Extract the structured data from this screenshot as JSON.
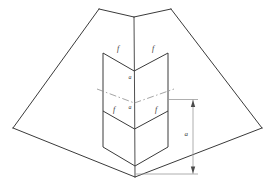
{
  "figure": {
    "background_color": "#ffffff",
    "line_color": "#3a3a3a",
    "centerline_color": "#777777",
    "dimension_color": "#8a8a8a",
    "width": 269,
    "height": 187
  },
  "labels": {
    "fold_top_left": "f",
    "fold_top_right": "f",
    "fold_bottom_left": "f",
    "fold_bottom_right": "f",
    "panel_upper": "a",
    "panel_lower": "a",
    "dimension_height": "a"
  },
  "geometry": {
    "outer_outline": "134,17 99,9 13,128 135,177 262,128 171,9",
    "outer_top_left_edge": "99,9 134,17",
    "outer_top_right_edge": "134,17 171,9",
    "outer_left_edge": "99,9 13,128",
    "outer_right_edge": "171,9 262,128",
    "outer_bottom_left_edge": "13,128 135,177",
    "outer_bottom_right_edge": "135,177 262,128",
    "spine_vertical": "134,17 135,177",
    "inner_left_vertical": "103,53 103,147",
    "inner_right_vertical": "168,53 168,147",
    "inner_upper_v_left": "103,53 134,71",
    "inner_upper_v_right": "134,71 168,53",
    "inner_mid_v_left": "103,111 134,129",
    "inner_mid_v_right": "134,129 168,111",
    "inner_lower_v_left": "103,147 135,166",
    "inner_lower_v_right": "135,166 168,147",
    "centerline": "99,89 134,103 172,89",
    "dim_line_x": 193,
    "dim_top_y": 99,
    "dim_bottom_y": 174,
    "dim_ext_top": "168,99 197,99",
    "dim_ext_bottom": "135,174 197,174"
  }
}
